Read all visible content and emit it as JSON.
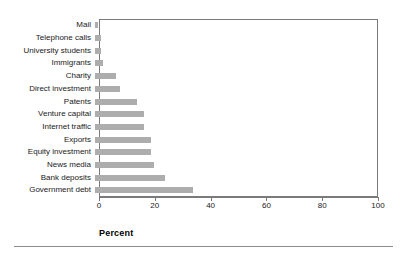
{
  "chart_data": {
    "type": "bar",
    "orientation": "horizontal",
    "title": "",
    "xlabel": "Percent",
    "ylabel": "",
    "xlim": [
      0,
      100
    ],
    "xticks": [
      0,
      20,
      40,
      60,
      80,
      100
    ],
    "grid": false,
    "legend": null,
    "bar_color": "#adadad",
    "axis_color": "#7a7a7a",
    "categories": [
      "Mail",
      "Telephone calls",
      "University students",
      "Immigrants",
      "Charity",
      "Direct investment",
      "Patents",
      "Venture capital",
      "Internet traffic",
      "Exports",
      "Equity investment",
      "News media",
      "Bank deposits",
      "Government debt"
    ],
    "values": [
      1,
      2,
      2,
      3,
      7.5,
      9,
      15,
      17.5,
      17.5,
      20,
      20,
      21,
      25,
      35
    ]
  }
}
